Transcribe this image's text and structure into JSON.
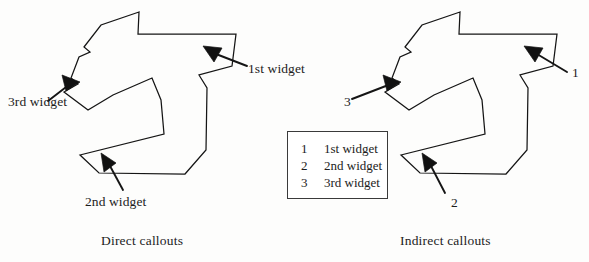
{
  "figure": {
    "panels": [
      {
        "id": "direct",
        "caption": "Direct callouts",
        "callouts": [
          {
            "id": "first",
            "label": "1st widget"
          },
          {
            "id": "second",
            "label": "2nd widget"
          },
          {
            "id": "third",
            "label": "3rd widget"
          }
        ]
      },
      {
        "id": "indirect",
        "caption": "Indirect callouts",
        "callouts": [
          {
            "id": "first",
            "label": "1"
          },
          {
            "id": "second",
            "label": "2"
          },
          {
            "id": "third",
            "label": "3"
          }
        ],
        "legend": {
          "rows": [
            {
              "key": "1",
              "text": "1st widget"
            },
            {
              "key": "2",
              "text": "2nd widget"
            },
            {
              "key": "3",
              "text": "3rd widget"
            }
          ]
        }
      }
    ],
    "colors": {
      "ink": "#151515",
      "arrow_fill": "#111111",
      "legend_border": "#3a3a3a",
      "background": "#fdfdfc"
    }
  }
}
